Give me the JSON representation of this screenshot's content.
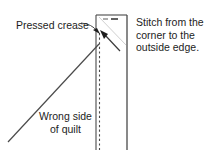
{
  "figure": {
    "background_color": "#ffffff",
    "ink_color": "#1d1d1d",
    "line_color": "#4a4a4a",
    "width": 210,
    "height": 150
  },
  "labels": {
    "pressed_crease": "Pressed crease",
    "stitch_line1": "Stitch from the",
    "stitch_line2": "corner to the",
    "stitch_line3": "outside edge.",
    "wrong_side_line1": "Wrong side",
    "wrong_side_line2": "of quilt"
  },
  "diagram": {
    "binding_strip": {
      "name": "binding-strip",
      "left_edge_x": 96,
      "right_edge_x": 127,
      "top_edge_y": 15,
      "bottom_edge_y": 150
    },
    "fold_crease_dashed_x": 99,
    "quilt_edge_diagonal": {
      "from_x": 8,
      "from_y": 142,
      "to_x": 99,
      "to_y": 44
    },
    "stitch_arrow": {
      "from_x": 118,
      "from_y": 49,
      "to_x": 101,
      "to_y": 31,
      "direction": "up-left"
    },
    "crease_leader": {
      "from_x": 81,
      "from_y": 24,
      "to_x": 98,
      "to_y": 33
    },
    "top_tick_mark": {
      "x": 106,
      "y": 18,
      "width": 12
    }
  }
}
